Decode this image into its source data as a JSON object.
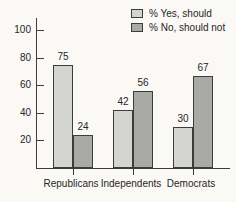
{
  "figure": {
    "background": "#faf9f6",
    "text_color": "#262626",
    "axis_color": "#3c3c3c"
  },
  "chart_data": {
    "type": "bar",
    "title": "",
    "xlabel": "",
    "ylabel": "",
    "categories": [
      "Republicans",
      "Independents",
      "Democrats"
    ],
    "series": [
      {
        "name": "% Yes, should",
        "values": [
          75,
          42,
          30
        ],
        "color": "#d4d4d0"
      },
      {
        "name": "% No, should not",
        "values": [
          24,
          56,
          67
        ],
        "color": "#a9a9a5"
      }
    ],
    "value_labels": [
      [
        "75",
        "42",
        "30"
      ],
      [
        "24",
        "56",
        "67"
      ]
    ],
    "yticks": [
      "20",
      "40",
      "60",
      "80",
      "100"
    ],
    "ylim": [
      0,
      108
    ],
    "grid": false,
    "legend_position": "top-right"
  }
}
